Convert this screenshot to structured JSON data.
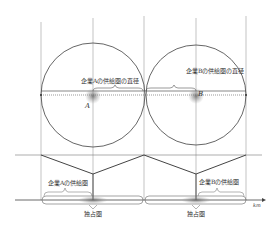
{
  "diagram": {
    "title": "",
    "firms": [
      {
        "id": "A",
        "label": "A",
        "diameter_label": "企業Aの供給圏の直径",
        "area_label": "企業Aの供給圏",
        "monopoly_label": "独占圏"
      },
      {
        "id": "B",
        "label": "B",
        "diameter_label": "企業Bの供給圏の直径",
        "area_label": "企業Bの供給圏",
        "monopoly_label": "独占圏"
      }
    ],
    "axis_unit": "km",
    "colors": {
      "line": "#555555",
      "guide": "#9a9a9a",
      "shade": "#7a7a7a"
    }
  }
}
